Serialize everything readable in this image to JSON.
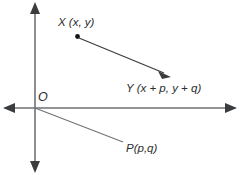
{
  "figure": {
    "type": "vector-translation-diagram",
    "background_color": "#ffffff",
    "axis_color": "#6f7173",
    "ink_color": "#3a3c3e",
    "labels": {
      "origin": "O",
      "point_x": "X (x, y)",
      "point_y": "Y (x + p, y + q)",
      "point_p": "P(p,q)"
    },
    "geometry": {
      "origin": {
        "x": 35,
        "y": 108
      },
      "x_axis": {
        "from_x": 4,
        "to_x": 236,
        "y": 108
      },
      "y_axis": {
        "x": 35,
        "from_y": 3,
        "to_y": 172
      },
      "point_x_dot": {
        "x": 77,
        "y": 36
      },
      "vector_xy": {
        "from_x": 78,
        "from_y": 37,
        "to_x": 170,
        "to_y": 76
      },
      "ray_op": {
        "from_x": 35,
        "from_y": 108,
        "to_x": 123,
        "to_y": 142
      }
    },
    "icons": {
      "arrow_left": "arrow-left-icon",
      "arrow_right": "arrow-right-icon",
      "arrow_up": "arrow-up-icon",
      "arrow_down": "arrow-down-icon",
      "vector_arrow": "vector-arrow-icon",
      "point_marker": "point-dot-icon"
    }
  }
}
